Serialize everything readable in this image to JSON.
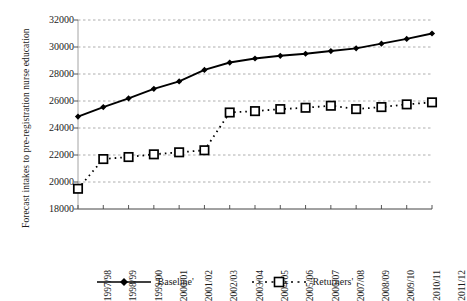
{
  "chart_data": {
    "type": "line",
    "title": "",
    "xlabel": "",
    "ylabel": "Forecast intakes to pre-registration nurse education",
    "ylim": [
      18000,
      32000
    ],
    "ytick_step": 2000,
    "grid": true,
    "legend_position": "bottom",
    "categories": [
      "1997/98",
      "1998/99",
      "1999/00",
      "2000/01",
      "2001/02",
      "2002/03",
      "2003/04",
      "2004/05",
      "2005/06",
      "2006/07",
      "2007/08",
      "2008/09",
      "2009/10",
      "2010/11",
      "2011/12"
    ],
    "yticks": [
      18000,
      20000,
      22000,
      24000,
      26000,
      28000,
      30000,
      32000
    ],
    "ytick_labels": [
      "18000",
      "20000",
      "22000",
      "24000",
      "26000",
      "28000",
      "30000",
      "32000"
    ],
    "series": [
      {
        "name": "'Baseline'",
        "marker": "diamond",
        "line_style": "solid",
        "color": "#000000",
        "values": [
          24850,
          25550,
          26200,
          26900,
          27450,
          28300,
          28850,
          29150,
          29350,
          29500,
          29700,
          29900,
          30250,
          30600,
          31000
        ]
      },
      {
        "name": "'Returners'",
        "marker": "square",
        "line_style": "dotted",
        "color": "#000000",
        "values": [
          19500,
          21700,
          21850,
          22050,
          22200,
          22350,
          25150,
          25250,
          25400,
          25500,
          25650,
          25400,
          25550,
          25750,
          25900
        ]
      }
    ]
  },
  "legend": {
    "items": [
      {
        "label": "'Baseline'",
        "marker": "diamond-marker-icon",
        "line": "solid-line-icon"
      },
      {
        "label": "'Returners'",
        "marker": "square-marker-icon",
        "line": "dotted-line-icon"
      }
    ]
  }
}
